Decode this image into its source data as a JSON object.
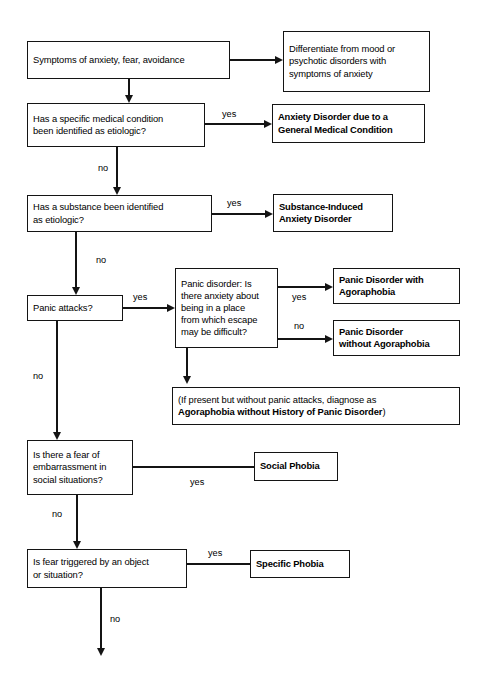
{
  "diagram": {
    "title_fragment": "",
    "type": "flowchart",
    "edge_labels": {
      "yes": "yes",
      "no": "no"
    },
    "nodes": {
      "start": {
        "id": "symptoms",
        "text": "Symptoms of anxiety, fear, avoidance",
        "bold": false
      },
      "differentiate": {
        "id": "differentiate",
        "text": "Differentiate from mood or\npsychotic disorders with\nsymptoms of anxiety",
        "bold": false
      },
      "medical_condition_q": {
        "id": "medical-condition-question",
        "text": "Has a specific medical condition\nbeen identified as etiologic?",
        "bold": false
      },
      "anxiety_gmc": {
        "id": "anxiety-disorder-gmc",
        "text": "Anxiety Disorder due to a\nGeneral Medical Condition",
        "bold": true
      },
      "substance_q": {
        "id": "substance-question",
        "text": "Has a substance been identified\nas etiologic?",
        "bold": false
      },
      "substance_induced": {
        "id": "substance-induced-anxiety-disorder",
        "text": "Substance-Induced\nAnxiety Disorder",
        "bold": true
      },
      "panic_attacks_q": {
        "id": "panic-attacks-question",
        "text": "Panic attacks?",
        "bold": false
      },
      "panic_disorder_q": {
        "id": "panic-disorder-question",
        "text": "Panic disorder: Is\nthere anxiety about\nbeing in a place\nfrom which escape\nmay be difficult?",
        "bold": false
      },
      "panic_with_agora": {
        "id": "panic-disorder-with-agoraphobia",
        "text": "Panic Disorder with\nAgoraphobia",
        "bold": true
      },
      "panic_without_agora": {
        "id": "panic-disorder-without-agoraphobia",
        "text": "Panic Disorder\nwithout Agoraphobia",
        "bold": true
      },
      "agora_note": {
        "id": "agoraphobia-note",
        "line1": "(If present but without panic attacks, diagnose as",
        "line2": "Agoraphobia without History of Panic Disorder",
        "line3": ")"
      },
      "social_fear_q": {
        "id": "social-fear-question",
        "text": "Is there a fear of\nembarrassment in\nsocial situations?",
        "bold": false
      },
      "social_phobia": {
        "id": "social-phobia",
        "text": "Social Phobia",
        "bold": true
      },
      "object_fear_q": {
        "id": "object-fear-question",
        "text": "Is fear triggered by an object\nor situation?",
        "bold": false
      },
      "specific_phobia": {
        "id": "specific-phobia",
        "text": "Specific Phobia",
        "bold": true
      }
    },
    "edges": [
      {
        "from": "symptoms",
        "to": "differentiate",
        "label": ""
      },
      {
        "from": "symptoms",
        "to": "medical-condition-question",
        "label": ""
      },
      {
        "from": "medical-condition-question",
        "to": "anxiety-disorder-gmc",
        "label": "yes"
      },
      {
        "from": "medical-condition-question",
        "to": "substance-question",
        "label": "no"
      },
      {
        "from": "substance-question",
        "to": "substance-induced-anxiety-disorder",
        "label": "yes"
      },
      {
        "from": "substance-question",
        "to": "panic-attacks-question",
        "label": "no"
      },
      {
        "from": "panic-attacks-question",
        "to": "panic-disorder-question",
        "label": "yes"
      },
      {
        "from": "panic-attacks-question",
        "to": "social-fear-question",
        "label": "no"
      },
      {
        "from": "panic-disorder-question",
        "to": "panic-disorder-with-agoraphobia",
        "label": "yes"
      },
      {
        "from": "panic-disorder-question",
        "to": "panic-disorder-without-agoraphobia",
        "label": "no"
      },
      {
        "from": "panic-disorder-question",
        "to": "agoraphobia-note",
        "label": ""
      },
      {
        "from": "social-fear-question",
        "to": "social-phobia",
        "label": "yes"
      },
      {
        "from": "social-fear-question",
        "to": "object-fear-question",
        "label": "no"
      },
      {
        "from": "object-fear-question",
        "to": "specific-phobia",
        "label": "yes"
      },
      {
        "from": "object-fear-question",
        "to": "",
        "label": "no"
      }
    ],
    "colors": {
      "stroke": "#141414",
      "background": "#ffffff",
      "text": "#000000"
    }
  }
}
